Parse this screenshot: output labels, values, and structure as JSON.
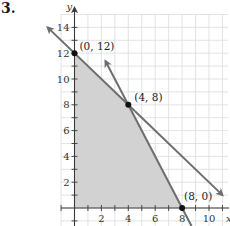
{
  "problem_number": "3.",
  "colors": {
    "grid": "#dcdcdc",
    "axis": "#3a3a3a",
    "line": "#6e6e6e",
    "shade": "#d2d2d2",
    "point": "#111111"
  },
  "chart_data": {
    "type": "line",
    "title": "",
    "xlabel": "x",
    "ylabel": "y",
    "xlim": [
      -1,
      11.5
    ],
    "ylim": [
      -1.4,
      15
    ],
    "grid": true,
    "x_ticks": [
      2,
      4,
      6,
      8,
      10
    ],
    "y_ticks": [
      2,
      4,
      6,
      8,
      10,
      12,
      14
    ],
    "series": [
      {
        "name": "Line 1",
        "equation": "y = 12 - x",
        "points": [
          [
            -2,
            14
          ],
          [
            11,
            1
          ]
        ],
        "arrows": "both"
      },
      {
        "name": "Line 2",
        "equation": "y = 16 - 2x",
        "points": [
          [
            2.3,
            11.4
          ],
          [
            8.7,
            -1.4
          ]
        ],
        "arrows": "upper"
      }
    ],
    "shaded_region": {
      "vertices": [
        [
          0,
          0
        ],
        [
          0,
          12
        ],
        [
          4,
          8
        ],
        [
          8,
          0
        ]
      ]
    },
    "labeled_points": [
      {
        "label": "(0, 12)",
        "x": 0,
        "y": 12
      },
      {
        "label": "(4, 8)",
        "x": 4,
        "y": 8
      },
      {
        "label": "(8, 0)",
        "x": 8,
        "y": 0
      }
    ]
  }
}
